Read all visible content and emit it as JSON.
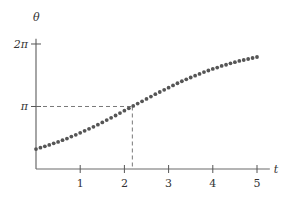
{
  "chart_data": {
    "type": "scatter",
    "title": "",
    "xlabel": "t",
    "ylabel": "θ",
    "xlim": [
      0,
      5.2
    ],
    "ylim": [
      0,
      6.9
    ],
    "grid": false,
    "legend": null,
    "x_ticks": [
      {
        "value": 1,
        "label": "1"
      },
      {
        "value": 2,
        "label": "2"
      },
      {
        "value": 3,
        "label": "3"
      },
      {
        "value": 4,
        "label": "4"
      },
      {
        "value": 5,
        "label": "5"
      }
    ],
    "y_ticks": [
      {
        "value": 3.1416,
        "label": "π"
      },
      {
        "value": 6.2832,
        "label": "2π"
      }
    ],
    "annotations": [
      {
        "type": "dashed-guide",
        "description": "inflection point where θ = π",
        "x": 2.18,
        "y": 3.1416
      }
    ],
    "series": [
      {
        "name": "θ(t)",
        "color": "#555555",
        "x": [
          0,
          0.1,
          0.2,
          0.3,
          0.4,
          0.5,
          0.6,
          0.7,
          0.8,
          0.9,
          1.0,
          1.1,
          1.2,
          1.3,
          1.4,
          1.5,
          1.6,
          1.7,
          1.8,
          1.9,
          2.0,
          2.1,
          2.2,
          2.3,
          2.4,
          2.5,
          2.6,
          2.7,
          2.8,
          2.9,
          3.0,
          3.1,
          3.2,
          3.3,
          3.4,
          3.5,
          3.6,
          3.7,
          3.8,
          3.9,
          4.0,
          4.1,
          4.2,
          4.3,
          4.4,
          4.5,
          4.6,
          4.7,
          4.8,
          4.9,
          5.0
        ],
        "y": [
          1.0,
          1.07,
          1.14,
          1.21,
          1.29,
          1.36,
          1.45,
          1.53,
          1.63,
          1.72,
          1.82,
          1.92,
          2.02,
          2.12,
          2.23,
          2.34,
          2.46,
          2.57,
          2.69,
          2.81,
          2.93,
          3.05,
          3.17,
          3.29,
          3.4,
          3.52,
          3.64,
          3.76,
          3.87,
          3.98,
          4.09,
          4.2,
          4.31,
          4.41,
          4.51,
          4.6,
          4.69,
          4.78,
          4.87,
          4.95,
          5.03,
          5.1,
          5.18,
          5.24,
          5.31,
          5.37,
          5.43,
          5.48,
          5.53,
          5.58,
          5.63
        ]
      }
    ]
  }
}
